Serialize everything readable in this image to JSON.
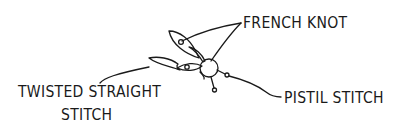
{
  "diagram": {
    "labels": {
      "french_knot": "FRENCH KNOT",
      "pistil_stitch": "PISTIL STITCH",
      "twisted_straight_line1": "TWISTED STRAIGHT",
      "twisted_straight_line2": "STITCH"
    },
    "elements": [
      {
        "name": "petal-upper",
        "stitch": "twisted straight stitch",
        "has_knot": true
      },
      {
        "name": "petal-upper-right",
        "stitch": "twisted straight stitch",
        "has_knot": false
      },
      {
        "name": "petal-left",
        "stitch": "twisted straight stitch",
        "has_knot": false
      },
      {
        "name": "petal-lower",
        "stitch": "twisted straight stitch",
        "has_knot": true
      },
      {
        "name": "flower-center",
        "stitch": "circle",
        "has_knot": false
      },
      {
        "name": "pistil-down",
        "stitch": "pistil stitch",
        "has_knot": true
      },
      {
        "name": "pistil-right",
        "stitch": "pistil stitch",
        "has_knot": true
      }
    ],
    "stroke_color": "#1a1a1a",
    "background_color": "#ffffff"
  }
}
